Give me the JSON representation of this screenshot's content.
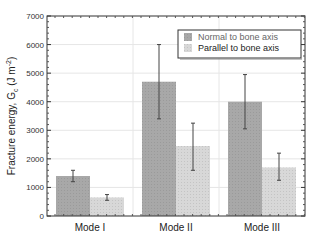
{
  "chart_data": {
    "type": "bar",
    "title": "",
    "xlabel": "",
    "ylabel": "Fracture energy, G_c (J m^-2)",
    "ylabel_parts": {
      "main": "Fracture energy, G",
      "sub": "c",
      "unit_open": " (J m",
      "sup": "-2",
      "unit_close": ")"
    },
    "ylim": [
      0,
      7000
    ],
    "yticks": [
      0,
      1000,
      2000,
      3000,
      4000,
      5000,
      6000,
      7000
    ],
    "grid": true,
    "legend_position": "upper right",
    "categories": [
      "Mode I",
      "Mode II",
      "Mode III"
    ],
    "series": [
      {
        "name": "Normal to bone axis",
        "color": "#a8a8a8",
        "values": [
          1400,
          4700,
          4000
        ],
        "error_low": [
          1200,
          3400,
          3050
        ],
        "error_high": [
          1600,
          6000,
          4950
        ]
      },
      {
        "name": "Parallel to bone axis",
        "color": "#d8d8d8",
        "values": [
          650,
          2450,
          1700
        ],
        "error_low": [
          550,
          1600,
          1250
        ],
        "error_high": [
          750,
          3250,
          2200
        ]
      }
    ]
  }
}
